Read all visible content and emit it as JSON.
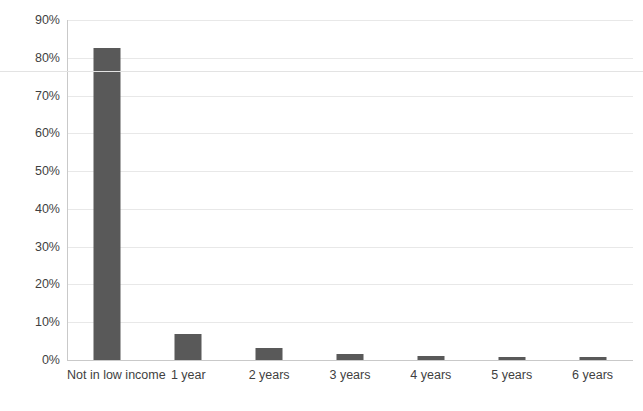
{
  "chart_data": {
    "type": "bar",
    "title": "",
    "subtitle": "",
    "xlabel": "",
    "ylabel": "",
    "categories": [
      "Not in low income",
      "1 year",
      "2 years",
      "3 years",
      "4 years",
      "5 years",
      "6 years"
    ],
    "values": [
      82.6,
      7.0,
      3.2,
      1.5,
      1.0,
      0.9,
      0.8
    ],
    "series": [
      {
        "name": "Share of population",
        "values": [
          82.6,
          7.0,
          3.2,
          1.5,
          1.0,
          0.9,
          0.8
        ]
      }
    ],
    "ylim": [
      0,
      90
    ],
    "ytick_values": [
      0,
      10,
      20,
      30,
      40,
      50,
      60,
      70,
      80,
      90
    ],
    "ytick_labels": [
      "0%",
      "10%",
      "20%",
      "30%",
      "40%",
      "50%",
      "60%",
      "70%",
      "80%",
      "90%"
    ],
    "grid": true,
    "grid_axis": "y",
    "legend": false,
    "legend_position": "none",
    "bar_color": "#595959",
    "gridline_color": "#e8e8e8",
    "axis_color": "#c9c9c9",
    "text_color": "#3f3f3f",
    "background_color": "#ffffff"
  }
}
